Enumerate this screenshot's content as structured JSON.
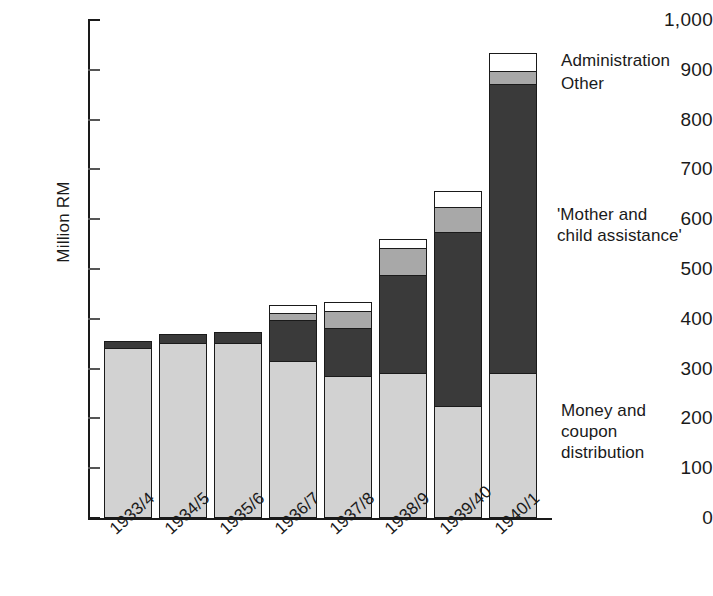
{
  "chart_data": {
    "type": "bar",
    "stacked": true,
    "title": "",
    "xlabel": "",
    "ylabel": "Million RM",
    "ylim": [
      0,
      1000
    ],
    "ytick_values": [
      0,
      100,
      200,
      300,
      400,
      500,
      600,
      700,
      800,
      900,
      1000
    ],
    "ytick_labels": [
      "0",
      "100",
      "200",
      "300",
      "400",
      "500",
      "600",
      "700",
      "800",
      "900",
      "1,000"
    ],
    "grid": false,
    "legend_position": "right-inline-annotations",
    "categories": [
      "1933/4",
      "1934/5",
      "1935/6",
      "1936/7",
      "1937/8",
      "1938/9",
      "1939/40",
      "1940/1"
    ],
    "series": [
      {
        "name": "Money and coupon distribution",
        "color": "#d2d2d2",
        "values": [
          339,
          350,
          350,
          313,
          283,
          289,
          222,
          289
        ]
      },
      {
        "name": "'Mother and child assistance'",
        "color": "#3a3a3a",
        "values": [
          13,
          16,
          20,
          83,
          97,
          196,
          350,
          580
        ]
      },
      {
        "name": "Other",
        "color": "#a8a8a8",
        "values": [
          0,
          0,
          0,
          14,
          34,
          55,
          50,
          26
        ]
      },
      {
        "name": "Administration",
        "color": "#ffffff",
        "values": [
          0,
          0,
          0,
          14,
          16,
          16,
          31,
          34
        ]
      }
    ],
    "totals": [
      352,
      366,
      370,
      424,
      430,
      556,
      653,
      929
    ],
    "annotations": [
      {
        "text": "Administration",
        "points_to": "admin-segment"
      },
      {
        "text": "Other",
        "points_to": "other-segment"
      },
      {
        "text": "'Mother and\nchild assistance'",
        "points_to": "mother-segment"
      },
      {
        "text": "Money and\ncoupon\ndistribution",
        "points_to": "money-segment"
      }
    ]
  },
  "axis": {
    "y_title": "Million RM"
  },
  "annotations": {
    "administration": "Administration",
    "other": "Other",
    "mother_child": "'Mother and\nchild assistance'",
    "money_coupon": "Money and\ncoupon\ndistribution"
  }
}
